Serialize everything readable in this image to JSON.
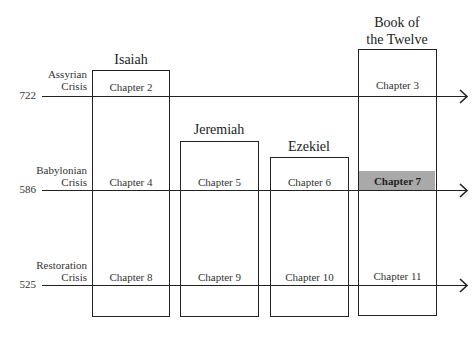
{
  "diagram": {
    "books": [
      {
        "name": "Isaiah",
        "title_lines": [
          "Isaiah"
        ]
      },
      {
        "name": "Jeremiah",
        "title_lines": [
          "Jeremiah"
        ]
      },
      {
        "name": "Ezekiel",
        "title_lines": [
          "Ezekiel"
        ]
      },
      {
        "name": "Book of the Twelve",
        "title_lines": [
          "Book of",
          "the Twelve"
        ]
      }
    ],
    "crises": [
      {
        "label_lines": [
          "Assyrian",
          "Crisis"
        ],
        "year": "722"
      },
      {
        "label_lines": [
          "Babylonian",
          "Crisis"
        ],
        "year": "586"
      },
      {
        "label_lines": [
          "Restoration",
          "Crisis"
        ],
        "year": "525"
      }
    ],
    "chapters": [
      [
        "Chapter 2",
        null,
        null,
        "Chapter 3"
      ],
      [
        "Chapter 4",
        "Chapter 5",
        "Chapter 6",
        "Chapter 7"
      ],
      [
        "Chapter 8",
        "Chapter 9",
        "Chapter 10",
        "Chapter 11"
      ]
    ],
    "highlighted_chapter": "Chapter 7",
    "colors": {
      "line": "#222222",
      "highlight": "#a9a9a9",
      "background": "#ffffff"
    }
  }
}
